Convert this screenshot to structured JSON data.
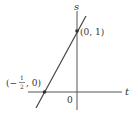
{
  "diagram": {
    "type": "line-graph",
    "axes": {
      "horizontal_label": "t",
      "vertical_label": "s",
      "origin_label": "0"
    },
    "points": [
      {
        "label": "(0, 1)",
        "t": 0,
        "s": 1
      },
      {
        "label_prefix": "(−",
        "frac_num": "1",
        "frac_den": "2",
        "label_suffix": ", 0)",
        "t": -0.5,
        "s": 0
      }
    ],
    "line": {
      "equation": "s = 2t + 1"
    },
    "colors": {
      "ink": "#333333",
      "background": "#ffffff"
    }
  }
}
